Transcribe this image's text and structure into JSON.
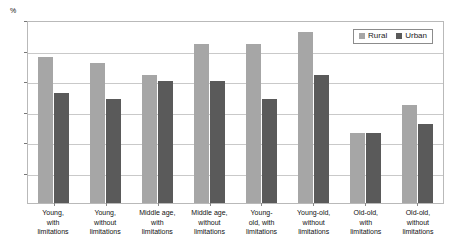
{
  "title_partial": "",
  "axis_unit": "%",
  "legend": {
    "position": "top-right",
    "items": [
      {
        "label": "Rural",
        "color": "#a6a6a6"
      },
      {
        "label": "Urban",
        "color": "#5a5a5a"
      }
    ]
  },
  "chart_data": {
    "type": "bar",
    "title": "",
    "xlabel": "",
    "ylabel": "%",
    "ylim": [
      0,
      30
    ],
    "yticks": [
      0,
      5,
      10,
      15,
      20,
      25,
      30
    ],
    "grid": true,
    "legend_position": "top-right",
    "categories": [
      "Young, with limitations",
      "Young, without limitations",
      "Middle age, with limitations",
      "Middle age, without limitations",
      "Young-old, with limitations",
      "Young-old, without limitations",
      "Old-old, with limitations",
      "Old-old, without limitations"
    ],
    "category_lines": [
      [
        "Young,",
        "with",
        "limitations"
      ],
      [
        "Young,",
        "without",
        "limitations"
      ],
      [
        "Middle age,",
        "with",
        "limitations"
      ],
      [
        "Middle age,",
        "without",
        "limitations"
      ],
      [
        "Young-",
        "old, with",
        "limitations"
      ],
      [
        "Young-old,",
        "without",
        "limitations"
      ],
      [
        "Old-old,",
        "with",
        "limitations"
      ],
      [
        "Old-old,",
        "without",
        "limitations"
      ]
    ],
    "series": [
      {
        "name": "Rural",
        "color": "#a6a6a6",
        "values": [
          24,
          23,
          21,
          26,
          26,
          28,
          11.5,
          16
        ]
      },
      {
        "name": "Urban",
        "color": "#5a5a5a",
        "values": [
          18,
          17,
          20,
          20,
          17,
          21,
          11.5,
          13
        ]
      }
    ]
  }
}
